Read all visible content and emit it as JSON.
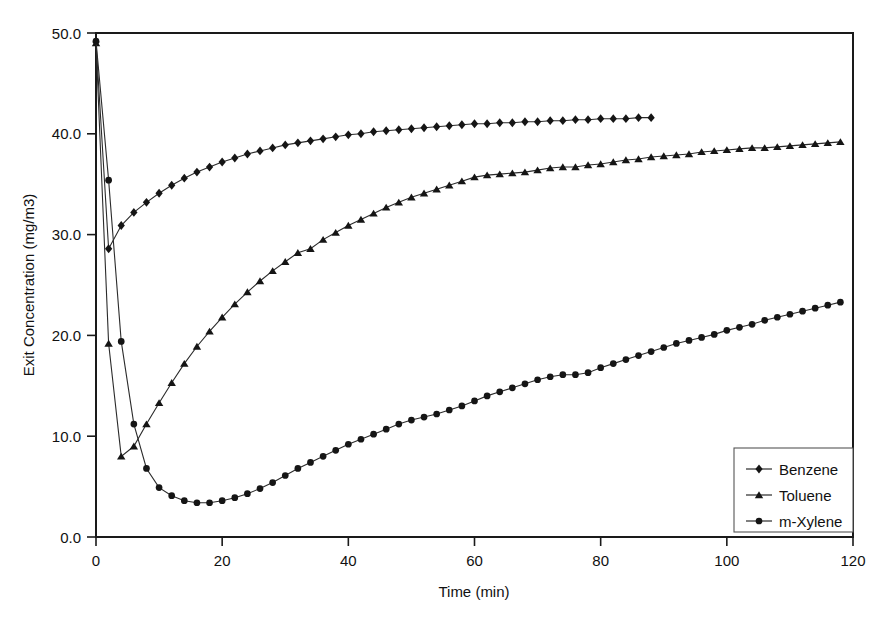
{
  "chart_data": {
    "type": "line",
    "title": "",
    "xlabel": "Time (min)",
    "ylabel": "Exit Concentration (mg/m3)",
    "xlim": [
      0,
      120
    ],
    "ylim": [
      0,
      50
    ],
    "xticks": [
      0,
      20,
      40,
      60,
      80,
      100,
      120
    ],
    "xtick_labels": [
      "0",
      "20",
      "40",
      "60",
      "80",
      "100",
      "120"
    ],
    "yticks": [
      0,
      10,
      20,
      30,
      40,
      50
    ],
    "ytick_labels": [
      "0.0",
      "10.0",
      "20.0",
      "30.0",
      "40.0",
      "50.0"
    ],
    "grid": false,
    "legend_position": "lower-right",
    "series": [
      {
        "name": "Benzene",
        "marker": "diamond",
        "color": "#151515",
        "x": [
          0,
          2,
          4,
          6,
          8,
          10,
          12,
          14,
          16,
          18,
          20,
          22,
          24,
          26,
          28,
          30,
          32,
          34,
          36,
          38,
          40,
          42,
          44,
          46,
          48,
          50,
          52,
          54,
          56,
          58,
          60,
          62,
          64,
          66,
          68,
          70,
          72,
          74,
          76,
          78,
          80,
          82,
          84,
          86,
          88
        ],
        "y": [
          49.1,
          28.6,
          30.9,
          32.2,
          33.2,
          34.1,
          34.9,
          35.6,
          36.2,
          36.7,
          37.2,
          37.6,
          38.0,
          38.3,
          38.6,
          38.9,
          39.1,
          39.3,
          39.5,
          39.7,
          39.9,
          40.0,
          40.2,
          40.3,
          40.4,
          40.5,
          40.6,
          40.7,
          40.8,
          40.9,
          41.0,
          41.0,
          41.1,
          41.1,
          41.2,
          41.2,
          41.3,
          41.3,
          41.4,
          41.4,
          41.5,
          41.5,
          41.5,
          41.6,
          41.6
        ]
      },
      {
        "name": "Toluene",
        "marker": "triangle",
        "color": "#151515",
        "x": [
          0,
          2,
          4,
          6,
          8,
          10,
          12,
          14,
          16,
          18,
          20,
          22,
          24,
          26,
          28,
          30,
          32,
          34,
          36,
          38,
          40,
          42,
          44,
          46,
          48,
          50,
          52,
          54,
          56,
          58,
          60,
          62,
          64,
          66,
          68,
          70,
          72,
          74,
          76,
          78,
          80,
          82,
          84,
          86,
          88,
          90,
          92,
          94,
          96,
          98,
          100,
          102,
          104,
          106,
          108,
          110,
          112,
          114,
          116,
          118
        ],
        "y": [
          49.0,
          19.2,
          8.0,
          9.0,
          11.2,
          13.3,
          15.3,
          17.2,
          18.9,
          20.4,
          21.8,
          23.1,
          24.3,
          25.4,
          26.4,
          27.3,
          28.2,
          28.6,
          29.5,
          30.2,
          30.9,
          31.5,
          32.1,
          32.7,
          33.2,
          33.7,
          34.1,
          34.5,
          34.9,
          35.3,
          35.7,
          35.9,
          36.0,
          36.1,
          36.2,
          36.4,
          36.6,
          36.7,
          36.7,
          36.9,
          37.0,
          37.2,
          37.4,
          37.5,
          37.7,
          37.8,
          37.9,
          38.0,
          38.2,
          38.3,
          38.4,
          38.5,
          38.6,
          38.6,
          38.7,
          38.8,
          38.9,
          39.0,
          39.1,
          39.2
        ]
      },
      {
        "name": "m-Xylene",
        "marker": "circle",
        "color": "#151515",
        "x": [
          0,
          2,
          4,
          6,
          8,
          10,
          12,
          14,
          16,
          18,
          20,
          22,
          24,
          26,
          28,
          30,
          32,
          34,
          36,
          38,
          40,
          42,
          44,
          46,
          48,
          50,
          52,
          54,
          56,
          58,
          60,
          62,
          64,
          66,
          68,
          70,
          72,
          74,
          76,
          78,
          80,
          82,
          84,
          86,
          88,
          90,
          92,
          94,
          96,
          98,
          100,
          102,
          104,
          106,
          108,
          110,
          112,
          114,
          116,
          118
        ],
        "y": [
          49.2,
          35.4,
          19.4,
          11.2,
          6.8,
          4.9,
          4.1,
          3.6,
          3.4,
          3.4,
          3.6,
          3.9,
          4.3,
          4.8,
          5.4,
          6.1,
          6.8,
          7.4,
          8.0,
          8.6,
          9.2,
          9.7,
          10.2,
          10.7,
          11.2,
          11.6,
          11.9,
          12.2,
          12.6,
          13.0,
          13.5,
          14.0,
          14.4,
          14.8,
          15.2,
          15.6,
          15.9,
          16.1,
          16.1,
          16.3,
          16.8,
          17.2,
          17.6,
          18.0,
          18.4,
          18.8,
          19.2,
          19.5,
          19.8,
          20.1,
          20.5,
          20.8,
          21.1,
          21.5,
          21.8,
          22.1,
          22.4,
          22.7,
          23.0,
          23.3
        ]
      }
    ]
  },
  "legend": {
    "entries": [
      {
        "label": "Benzene"
      },
      {
        "label": "Toluene"
      },
      {
        "label": "m-Xylene"
      }
    ]
  },
  "axes": {
    "x_title": "Time (min)",
    "y_title": "Exit Concentration (mg/m3)"
  }
}
